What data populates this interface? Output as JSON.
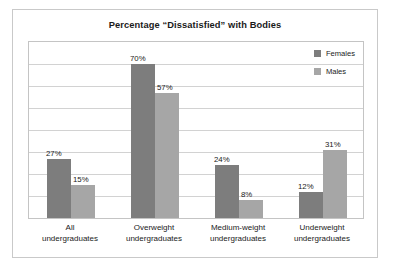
{
  "chart_data": {
    "type": "bar",
    "title": "Percentage “Dissatisfied” with Bodies",
    "xlabel": "",
    "ylabel": "",
    "ylim": [
      0,
      80
    ],
    "grid": true,
    "gridline_count": 8,
    "legend_position": "top-right",
    "value_suffix": "%",
    "categories": [
      "All undergraduates",
      "Overweight undergraduates",
      "Medium-weight undergraduates",
      "Underweight undergraduates"
    ],
    "series": [
      {
        "name": "Females",
        "color": "#7d7d7d",
        "values": [
          27,
          70,
          24,
          12
        ],
        "labels": [
          "27%",
          "70%",
          "24%",
          "12%"
        ]
      },
      {
        "name": "Males",
        "color": "#a6a6a6",
        "values": [
          15,
          57,
          8,
          31
        ],
        "labels": [
          "15%",
          "57%",
          "8%",
          "31%"
        ]
      }
    ]
  },
  "categories_display": [
    {
      "line1": "All",
      "line2": "undergraduates"
    },
    {
      "line1": "Overweight",
      "line2": "undergraduates"
    },
    {
      "line1": "Medium-weight",
      "line2": "undergraduates"
    },
    {
      "line1": "Underweight",
      "line2": "undergraduates"
    }
  ]
}
